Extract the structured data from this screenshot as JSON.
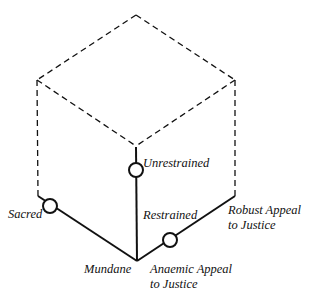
{
  "diagram": {
    "type": "isometric cube with three solid axes",
    "colors": {
      "line": "#111111",
      "background": "#ffffff"
    },
    "labels": {
      "unrestrained": "Unrestrained",
      "sacred": "Sacred",
      "restrained": "Restrained",
      "robust_1": "Robust Appeal",
      "robust_2": "to Justice",
      "mundane": "Mundane",
      "anaemic_1": "Anaemic Appeal",
      "anaemic_2": "to Justice"
    },
    "axes": [
      {
        "name": "vertical",
        "from": "Restrained",
        "to": "Unrestrained"
      },
      {
        "name": "left",
        "from": "Mundane",
        "to": "Sacred"
      },
      {
        "name": "right",
        "from": "Anaemic Appeal to Justice",
        "to": "Robust Appeal to Justice"
      }
    ],
    "markers": [
      {
        "axis": "vertical",
        "position": "near Unrestrained"
      },
      {
        "axis": "left",
        "position": "near Sacred"
      },
      {
        "axis": "right",
        "position": "near Anaemic Appeal to Justice"
      }
    ]
  }
}
